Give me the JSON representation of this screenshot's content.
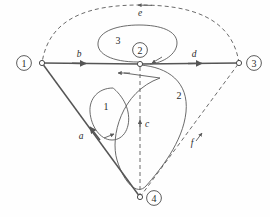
{
  "figure": {
    "type": "graph-diagram",
    "background_color": "#fefefe",
    "stroke_color": "#4a4a4a",
    "solid_stroke_color": "#555555",
    "text_color": "#2b2b2b"
  },
  "nodes": [
    {
      "id": "1",
      "label": "1",
      "x": 42,
      "y": 63,
      "label_x": 24,
      "label_y": 63
    },
    {
      "id": "2",
      "label": "2",
      "x": 140,
      "y": 64,
      "label_x": 140,
      "label_y": 50
    },
    {
      "id": "3",
      "label": "3",
      "x": 239,
      "y": 63,
      "label_x": 254,
      "label_y": 63
    },
    {
      "id": "4",
      "label": "4",
      "x": 140,
      "y": 197,
      "label_x": 154,
      "label_y": 198
    }
  ],
  "edges": [
    {
      "id": "a",
      "label": "a",
      "style": "solid",
      "from": "4",
      "to": "1",
      "label_x": 81,
      "label_y": 136
    },
    {
      "id": "b",
      "label": "b",
      "style": "solid",
      "from": "1",
      "to": "2",
      "label_x": 79,
      "label_y": 54
    },
    {
      "id": "c",
      "label": "c",
      "style": "dashed",
      "from": "4",
      "to": "2",
      "label_x": 147,
      "label_y": 124
    },
    {
      "id": "d",
      "label": "d",
      "style": "solid",
      "from": "2",
      "to": "3",
      "label_x": 194,
      "label_y": 54
    },
    {
      "id": "e",
      "label": "e",
      "style": "dashed",
      "from": "3",
      "to": "1",
      "label_x": 140,
      "label_y": 13
    },
    {
      "id": "f",
      "label": "f",
      "style": "dashed",
      "from": "4",
      "to": "3",
      "label_x": 192,
      "label_y": 143
    }
  ],
  "loops": [
    {
      "id": "loop1",
      "label": "1",
      "label_x": 106,
      "label_y": 106
    },
    {
      "id": "loop2",
      "label": "2",
      "label_x": 179,
      "label_y": 95
    },
    {
      "id": "loop3",
      "label": "3",
      "label_x": 118,
      "label_y": 40
    }
  ]
}
